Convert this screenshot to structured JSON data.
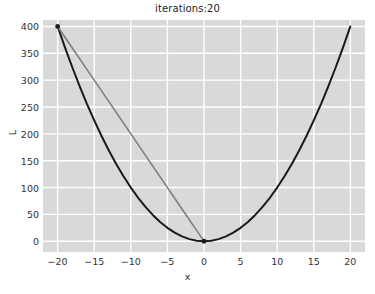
{
  "chart_data": {
    "type": "line",
    "title": "iterations:20",
    "xlabel": "x",
    "ylabel": "L",
    "xlim": [
      -22.0,
      22.0
    ],
    "ylim": [
      -20.0,
      412.0
    ],
    "grid": true,
    "legend": "none",
    "xticks": [
      -20,
      -15,
      -10,
      -5,
      0,
      5,
      10,
      15,
      20
    ],
    "xtick_labels": [
      "−20",
      "−15",
      "−10",
      "−5",
      "0",
      "5",
      "10",
      "15",
      "20"
    ],
    "yticks": [
      0,
      50,
      100,
      150,
      200,
      250,
      300,
      350,
      400
    ],
    "ytick_labels": [
      "0",
      "50",
      "100",
      "150",
      "200",
      "250",
      "300",
      "350",
      "400"
    ],
    "series": [
      {
        "name": "loss-curve",
        "type": "line",
        "color": "#1a1a1a",
        "linewidth": 2.0,
        "x": [
          -20,
          -19,
          -18,
          -17,
          -16,
          -15,
          -14,
          -13,
          -12,
          -11,
          -10,
          -9,
          -8,
          -7,
          -6,
          -5,
          -4,
          -3,
          -2,
          -1,
          0,
          1,
          2,
          3,
          4,
          5,
          6,
          7,
          8,
          9,
          10,
          11,
          12,
          13,
          14,
          15,
          16,
          17,
          18,
          19,
          20
        ],
        "values": [
          400,
          361,
          324,
          289,
          256,
          225,
          196,
          169,
          144,
          121,
          100,
          81,
          64,
          49,
          36,
          25,
          16,
          9,
          4,
          1,
          0,
          1,
          4,
          9,
          16,
          25,
          36,
          49,
          64,
          81,
          100,
          121,
          144,
          169,
          196,
          225,
          256,
          289,
          324,
          361,
          400
        ]
      },
      {
        "name": "gradient-descent-path",
        "type": "line",
        "color": "#808080",
        "linewidth": 1.6,
        "x": [
          -20.0,
          -17.6,
          -15.4,
          -13.3,
          -11.4,
          -9.6,
          -8.0,
          -6.5,
          -5.2,
          -4.1,
          -3.1,
          -2.3,
          -1.7,
          -1.2,
          -0.8,
          -0.5,
          -0.3,
          -0.2,
          -0.1,
          -0.05,
          0.0
        ],
        "values": [
          400.0,
          352.0,
          308.0,
          266.0,
          228.0,
          192.0,
          160.0,
          130.0,
          104.0,
          82.0,
          62.0,
          46.0,
          34.0,
          24.0,
          16.0,
          10.0,
          6.0,
          4.0,
          2.0,
          1.0,
          0.0
        ]
      }
    ],
    "markers": [
      {
        "name": "start-point",
        "x": -20,
        "y": 400,
        "color": "#1a1a1a"
      },
      {
        "name": "minimum-point",
        "x": 0,
        "y": 0,
        "color": "#1a1a1a"
      }
    ]
  }
}
